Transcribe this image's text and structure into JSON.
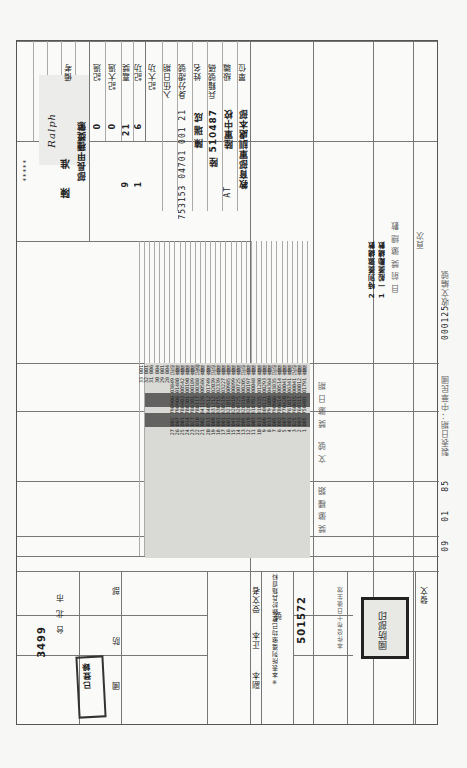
{
  "document": {
    "agency": "國防部",
    "agency_prefix": "檔號/保存年限",
    "doc_number_label": "收文編號",
    "doc_number": "000125",
    "date_label": "製表日期：中華民國",
    "date_year": "85",
    "date_month": "01",
    "date_day": "09",
    "date_units": [
      "年",
      "月",
      "日"
    ]
  },
  "left_panel": {
    "labels": [
      "單位",
      "級職",
      "兵籍號碼",
      "姓名",
      "身分證號",
      "入伍日期"
    ],
    "unit": "教育部軍訓處本部",
    "rank": "陸軍中校",
    "serial_no": "陸 510487",
    "name": "陳瑞成",
    "id_no": "753153 04701 001 21",
    "suffix": "AT",
    "counts_labels": [
      "記大功",
      "記功",
      "嘉獎",
      "記大過",
      "記過",
      "申誡"
    ],
    "counts": [
      "0",
      "6",
      "21",
      "0",
      "1",
      "9"
    ],
    "count_units": [
      "大",
      "功",
      "次",
      "過",
      "次",
      "次"
    ],
    "remark_label": "備考",
    "sign_label": "部長甲種獎懲",
    "approval": "陳 准",
    "signature": "Ralph",
    "dots": "*****",
    "bottom_labels": [
      "核",
      "定",
      "發",
      "布",
      "日",
      "期"
    ]
  },
  "table": {
    "header": [
      "頁次",
      "目 前 獎 懲 總 數",
      "獎 懲 日 期",
      "文 號",
      "號 碼",
      "獎 懲 事 由",
      "獎 懲 種 類"
    ],
    "summary_rows": [
      "1 一般獎勵總數",
      "2 特別獎懲總數"
    ],
    "rows": [
      {
        "no": "1",
        "code": "005",
        "date": "750401",
        "ref": "01791",
        "type": "嘉獎"
      },
      {
        "no": "2",
        "code": "003",
        "date": "760311",
        "ref": "00012",
        "type": "嘉獎"
      },
      {
        "no": "3",
        "code": "025",
        "date": "760615",
        "ref": "00041",
        "type": "記功"
      },
      {
        "no": "4",
        "code": "001",
        "date": "761017",
        "ref": "06341",
        "type": "嘉獎"
      },
      {
        "no": "5",
        "code": "007",
        "date": "770420",
        "ref": "00041",
        "type": "嘉獎"
      },
      {
        "no": "6",
        "code": "002",
        "date": "780614",
        "ref": "00514",
        "type": "嘉獎"
      },
      {
        "no": "7",
        "code": "005",
        "date": "790906",
        "ref": "03835",
        "type": "記功"
      },
      {
        "no": "8",
        "code": "013",
        "date": "791009",
        "ref": "04364",
        "type": "嘉獎"
      },
      {
        "no": "9",
        "code": "009",
        "date": "800121",
        "ref": "00293",
        "type": "嘉獎"
      },
      {
        "no": "10",
        "code": "013",
        "date": "810335",
        "ref": "01280",
        "type": "嘉獎"
      },
      {
        "no": "11",
        "code": "003",
        "date": "810702",
        "ref": "00048",
        "type": "嘉獎"
      },
      {
        "no": "12",
        "code": "019",
        "date": "820304",
        "ref": "00197",
        "type": "嘉獎"
      },
      {
        "no": "13",
        "code": "005",
        "date": "820316",
        "ref": "00205",
        "type": "記功"
      },
      {
        "no": "14",
        "code": "015",
        "date": "820725",
        "ref": "00725",
        "type": "嘉獎"
      },
      {
        "no": "15",
        "code": "045",
        "date": "820910",
        "ref": "00899",
        "type": "嘉獎"
      },
      {
        "no": "16",
        "code": "001",
        "date": "821015",
        "ref": "00985",
        "type": "嘉獎"
      },
      {
        "no": "17",
        "code": "001",
        "date": "830519",
        "ref": "03227",
        "type": "嘉獎"
      },
      {
        "no": "18",
        "code": "003",
        "date": "830715",
        "ref": "02339",
        "type": "嘉獎"
      },
      {
        "no": "19",
        "code": "009",
        "date": "831212",
        "ref": "02039",
        "type": "記功"
      },
      {
        "no": "20",
        "code": "013",
        "date": "840512",
        "ref": "01749",
        "type": "嘉獎"
      },
      {
        "no": "21",
        "code": "002",
        "date": "841126",
        "ref": "00586",
        "type": "嘉獎"
      },
      {
        "no": "22",
        "code": "010",
        "date": "780117",
        "ref": "00388",
        "type": "記過"
      },
      {
        "no": "23",
        "code": "027",
        "date": "780301",
        "ref": "00189",
        "type": "嘉獎"
      },
      {
        "no": "24",
        "code": "014",
        "date": "780301",
        "ref": "00190",
        "type": "嘉獎"
      },
      {
        "no": "25",
        "code": "001",
        "date": "780403",
        "ref": "00542",
        "type": "嘉獎"
      },
      {
        "no": "26",
        "code": "007",
        "date": "790906",
        "ref": "01480",
        "type": "嘉獎"
      },
      {
        "no": "27",
        "code": "002",
        "date": "790906",
        "ref": "03849",
        "type": "記功"
      },
      {
        "no": "28",
        "code": "004",
        "date": "",
        "ref": "",
        "type": ""
      },
      {
        "no": "29",
        "code": "001",
        "date": "",
        "ref": "",
        "type": ""
      },
      {
        "no": "30",
        "code": "004",
        "date": "",
        "ref": "",
        "type": ""
      },
      {
        "no": "31",
        "code": "006",
        "date": "",
        "ref": "",
        "type": ""
      },
      {
        "no": "32",
        "code": "001",
        "date": "",
        "ref": "",
        "type": ""
      },
      {
        "no": "33",
        "code": "001",
        "date": "",
        "ref": "",
        "type": ""
      }
    ],
    "footnote": "※本表所列獎懲均已登錄於兵籍資料"
  },
  "right_panel": {
    "label_top": "發文",
    "serial_label": "字號",
    "serial_value": "501572",
    "word_label": "號",
    "note": "本件發布十日後生效",
    "recipient_labels": [
      "受文者",
      "正本",
      "副本"
    ],
    "sender_labels": [
      "部",
      "防",
      "國"
    ],
    "date_stamp": "3499",
    "city": "台北市",
    "stamp_text": "國防部印",
    "tag": "已登錄"
  }
}
